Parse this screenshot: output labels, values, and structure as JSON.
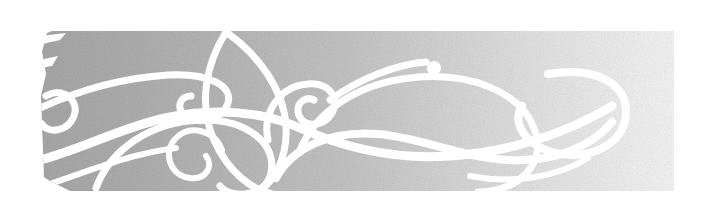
{
  "banner": {
    "type": "decorative-flourish-banner",
    "width": 701,
    "height": 208,
    "alt_text": "Decorative ornamental banner with white calligraphic scroll flourishes on a grey gradient band",
    "background_color": "#ffffff",
    "band": {
      "name": "grey-gradient-band",
      "left": 42,
      "right": 674,
      "top": 31,
      "bottom": 191,
      "gradient_from": "#ababab",
      "gradient_mid": "#c9c9c9",
      "gradient_to": "#f2f2f2",
      "texture": "grainy-noise",
      "left_edge_style": "slanted-torn"
    },
    "ornament": {
      "name": "white-scroll-flourishes",
      "stroke_color": "#ffffff",
      "stroke_widths": [
        5,
        6,
        7,
        8
      ],
      "motifs": [
        "large-left-sweeping-curve",
        "inner-spiral-left",
        "leaf-teardrop-center",
        "center-spiral-hook",
        "long-sweeping-s-curve",
        "ball-terminal-dot",
        "large-right-hook-curl",
        "lower-arc-ribbon"
      ],
      "ball_terminal": {
        "cx": 434,
        "cy": 68,
        "r": 7
      }
    }
  }
}
